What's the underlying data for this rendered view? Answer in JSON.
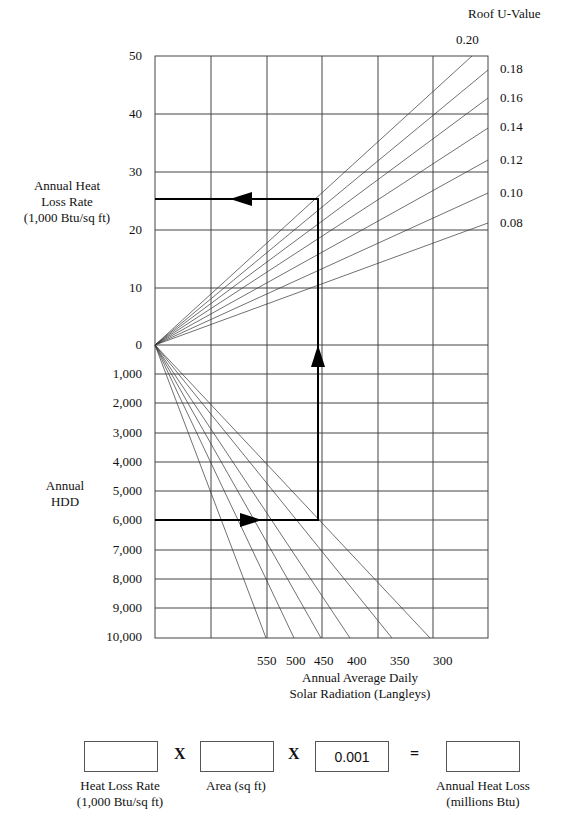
{
  "chart_data": {
    "type": "line",
    "title": "",
    "upper_axis": {
      "label": "Annual Heat Loss Rate (1,000 Btu/sq ft)",
      "ticks": [
        "50",
        "40",
        "30",
        "20",
        "10",
        "0"
      ],
      "range": [
        0,
        50
      ]
    },
    "lower_axis": {
      "label": "Annual HDD",
      "ticks": [
        "1,000",
        "2,000",
        "3,000",
        "4,000",
        "5,000",
        "6,000",
        "7,000",
        "8,000",
        "9,000",
        "10,000"
      ],
      "range": [
        0,
        10000
      ]
    },
    "x_axis": {
      "label": "Annual Average Daily Solar Radiation (Langleys)",
      "ticks": [
        "550",
        "500",
        "450",
        "400",
        "350",
        "300"
      ]
    },
    "legend_title": "Roof U-Value",
    "upper_series": [
      {
        "name": "0.20",
        "end": [
          472,
          56
        ]
      },
      {
        "name": "0.18",
        "end": [
          488,
          70
        ]
      },
      {
        "name": "0.16",
        "end": [
          488,
          98
        ]
      },
      {
        "name": "0.14",
        "end": [
          488,
          128
        ]
      },
      {
        "name": "0.12",
        "end": [
          488,
          160
        ]
      },
      {
        "name": "0.10",
        "end": [
          488,
          193
        ]
      },
      {
        "name": "0.08",
        "end": [
          488,
          223
        ]
      }
    ],
    "lower_series": [
      {
        "name": "550",
        "end": [
          266,
          638
        ]
      },
      {
        "name": "500",
        "end": [
          294,
          638
        ]
      },
      {
        "name": "450",
        "end": [
          321,
          638
        ]
      },
      {
        "name": "400",
        "end": [
          350,
          638
        ]
      },
      {
        "name": "350",
        "end": [
          392,
          638
        ]
      },
      {
        "name": "300",
        "end": [
          430,
          638
        ]
      }
    ],
    "example_path": {
      "hdd": 6000,
      "solar_radiation": 450,
      "heat_loss_rate": 25.5
    },
    "grid": true
  },
  "labels": {
    "legend_title": "Roof U-Value",
    "u_values": [
      "0.20",
      "0.18",
      "0.16",
      "0.14",
      "0.12",
      "0.10",
      "0.08"
    ],
    "upper_axis_title": [
      "Annual Heat",
      "Loss Rate",
      "(1,000 Btu/sq ft)"
    ],
    "upper_ticks": [
      "50",
      "40",
      "30",
      "20",
      "10",
      "0"
    ],
    "lower_axis_title": [
      "Annual",
      "HDD"
    ],
    "lower_ticks": [
      "1,000",
      "2,000",
      "3,000",
      "4,000",
      "5,000",
      "6,000",
      "7,000",
      "8,000",
      "9,000",
      "10,000"
    ],
    "solar_ticks": [
      "550",
      "500",
      "450",
      "400",
      "350",
      "300"
    ],
    "x_axis_title": [
      "Annual Average Daily",
      "Solar Radiation (Langleys)"
    ]
  },
  "formula": {
    "box1_value": "",
    "box1_label": [
      "Heat Loss Rate",
      "(1,000 Btu/sq ft)"
    ],
    "op1": "X",
    "box2_value": "",
    "box2_label": [
      "Area (sq ft)"
    ],
    "op2": "X",
    "box3_value": "0.001",
    "op3": "=",
    "box4_value": "",
    "box4_label": [
      "Annual Heat Loss",
      "(millions Btu)"
    ]
  }
}
